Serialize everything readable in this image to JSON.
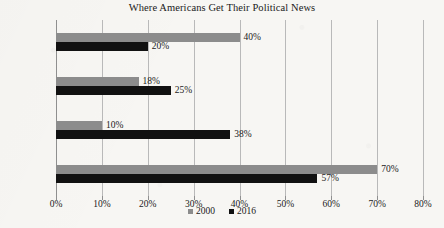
{
  "chart_data": {
    "type": "bar",
    "orientation": "horizontal",
    "title": "Where Americans Get Their Political News",
    "xlabel": "",
    "ylabel": "",
    "categories": [
      "Newspaper",
      "Radio",
      "Internet",
      "TV"
    ],
    "series": [
      {
        "name": "2000",
        "color": "#8c8c8c",
        "values": [
          40,
          18,
          10,
          70
        ]
      },
      {
        "name": "2016",
        "color": "#111111",
        "values": [
          20,
          25,
          38,
          57
        ]
      }
    ],
    "value_labels": {
      "2000": [
        "40%",
        "18%",
        "10%",
        "70%"
      ],
      "2016": [
        "20%",
        "25%",
        "38%",
        "57%"
      ]
    },
    "xlim": [
      0,
      80
    ],
    "xticks": [
      0,
      10,
      20,
      30,
      40,
      50,
      60,
      70,
      80
    ],
    "xtick_labels": [
      "0%",
      "10%",
      "20%",
      "30%",
      "40%",
      "50%",
      "60%",
      "70%",
      "80%"
    ],
    "grid": true,
    "legend_position": "bottom",
    "legend_entries": [
      "2000",
      "2016"
    ]
  }
}
